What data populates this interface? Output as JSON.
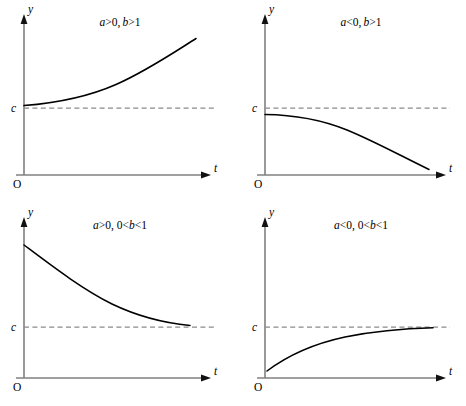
{
  "figure": {
    "background_color": "#ffffff",
    "axis_color": "#808080",
    "curve_color": "#000000",
    "asymptote_color": "#8a8a8a",
    "grid_rows": 2,
    "grid_cols": 2
  },
  "labels": {
    "y_axis": "y",
    "t_axis": "t",
    "origin": "O",
    "asymptote": "c"
  },
  "chart_data": [
    {
      "type": "line",
      "panel_id": "top-left",
      "title": "a>0, b>1",
      "title_parts": [
        {
          "text": "a",
          "italic": true
        },
        {
          "text": ">0, ",
          "italic": false
        },
        {
          "text": "b",
          "italic": true
        },
        {
          "text": ">1",
          "italic": false
        }
      ],
      "xlabel": "t",
      "ylabel": "y",
      "asymptote_label": "c",
      "asymptote_y": 0.36,
      "behavior": "increasing exponential growth above the asymptote",
      "curve_start": {
        "t": 0.0,
        "y": 0.42
      },
      "curve_end": {
        "t": 0.88,
        "y": 0.93
      },
      "concavity": "up",
      "grid": false,
      "legend": "none",
      "x": [
        0.0,
        0.11,
        0.22,
        0.33,
        0.44,
        0.55,
        0.66,
        0.77,
        0.88
      ],
      "y": [
        0.42,
        0.435,
        0.46,
        0.495,
        0.545,
        0.615,
        0.705,
        0.81,
        0.93
      ]
    },
    {
      "type": "line",
      "panel_id": "top-right",
      "title": "a<0, b>1",
      "title_parts": [
        {
          "text": "a",
          "italic": true
        },
        {
          "text": "<0, ",
          "italic": false
        },
        {
          "text": "b",
          "italic": true
        },
        {
          "text": ">1",
          "italic": false
        }
      ],
      "xlabel": "t",
      "ylabel": "y",
      "asymptote_label": "c",
      "asymptote_y": 0.36,
      "behavior": "decreasing exponential, curving down away from the asymptote",
      "curve_start": {
        "t": 0.0,
        "y": 0.325
      },
      "curve_end": {
        "t": 0.88,
        "y": 0.035
      },
      "concavity": "down",
      "grid": false,
      "legend": "none",
      "x": [
        0.0,
        0.11,
        0.22,
        0.33,
        0.44,
        0.55,
        0.66,
        0.77,
        0.88
      ],
      "y": [
        0.325,
        0.318,
        0.305,
        0.285,
        0.255,
        0.215,
        0.165,
        0.105,
        0.035
      ]
    },
    {
      "type": "line",
      "panel_id": "bottom-left",
      "title": "a>0, 0<b<1",
      "title_parts": [
        {
          "text": "a",
          "italic": true
        },
        {
          "text": ">0, 0<",
          "italic": false
        },
        {
          "text": "b",
          "italic": true
        },
        {
          "text": "<1",
          "italic": false
        }
      ],
      "xlabel": "t",
      "ylabel": "y",
      "asymptote_label": "c",
      "asymptote_y": 0.36,
      "behavior": "exponential decay from above, approaching the asymptote",
      "curve_start": {
        "t": 0.0,
        "y": 0.86
      },
      "curve_end": {
        "t": 0.82,
        "y": 0.385
      },
      "concavity": "up",
      "grid": false,
      "legend": "none",
      "x": [
        0.0,
        0.1,
        0.21,
        0.31,
        0.41,
        0.51,
        0.62,
        0.72,
        0.82
      ],
      "y": [
        0.86,
        0.745,
        0.645,
        0.565,
        0.5,
        0.45,
        0.415,
        0.395,
        0.385
      ]
    },
    {
      "type": "line",
      "panel_id": "bottom-right",
      "title": "a<0, 0<b<1",
      "title_parts": [
        {
          "text": "a",
          "italic": true
        },
        {
          "text": "<0, 0<",
          "italic": false
        },
        {
          "text": "b",
          "italic": true
        },
        {
          "text": "<1",
          "italic": false
        }
      ],
      "xlabel": "t",
      "ylabel": "y",
      "asymptote_label": "c",
      "asymptote_y": 0.36,
      "behavior": "exponential rise from below, approaching the asymptote",
      "curve_start": {
        "t": 0.0,
        "y": 0.055
      },
      "curve_end": {
        "t": 0.86,
        "y": 0.335
      },
      "concavity": "down",
      "grid": false,
      "legend": "none",
      "x": [
        0.0,
        0.11,
        0.21,
        0.32,
        0.43,
        0.54,
        0.64,
        0.75,
        0.86
      ],
      "y": [
        0.055,
        0.155,
        0.215,
        0.26,
        0.29,
        0.31,
        0.322,
        0.33,
        0.335
      ]
    }
  ]
}
